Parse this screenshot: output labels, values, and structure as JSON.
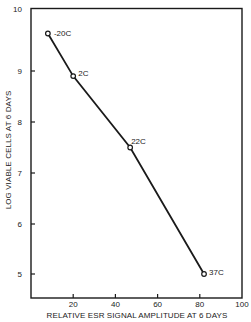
{
  "chart_data": {
    "type": "line",
    "title": "",
    "xlabel": "RELATIVE ESR SIGNAL AMPLITUDE AT 6 DAYS",
    "ylabel": "LOG VIABLE CELLS AT 6 DAYS",
    "xlim": [
      0,
      100
    ],
    "ylim": [
      4.5,
      10
    ],
    "x_ticks": [
      20,
      40,
      60,
      80,
      100
    ],
    "y_ticks": [
      5,
      6,
      7,
      8,
      9,
      10
    ],
    "grid": false,
    "legend": null,
    "series": [
      {
        "name": "temperature",
        "marker": "open-circle",
        "points": [
          {
            "label": "-20C",
            "x": 8,
            "y": 9.6
          },
          {
            "label": "2C",
            "x": 20,
            "y": 8.9
          },
          {
            "label": "22C",
            "x": 47,
            "y": 7.5
          },
          {
            "label": "37C",
            "x": 82,
            "y": 5.0
          }
        ]
      }
    ]
  },
  "colors": {
    "line": "#1a1a1a",
    "background": "#ffffff"
  }
}
